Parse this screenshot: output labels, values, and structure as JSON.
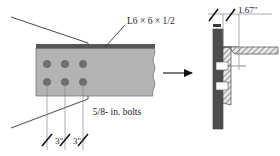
{
  "figure": {
    "labels": {
      "angle_designation": "L6 × 6 × 1/2",
      "bolt_note": "5/8- in. bolts",
      "spacing_1": "3\"",
      "spacing_2": "3\"",
      "edge_distance": "1.67\""
    },
    "colors": {
      "plate_face": "#b3b3b3",
      "plate_top_edge": "#555555",
      "bolt_hole": "#6e6e6e",
      "column": "#4d4d4d",
      "hatch_fill": "#e8e8e8",
      "hatch_line": "#4d4d4d",
      "line": "#333333",
      "text": "#1a1a1a",
      "background": "#ffffff"
    },
    "views": {
      "left": {
        "name": "elevation-view",
        "description": "Front elevation of angle leg showing 6 bolt holes in two rows of three",
        "bolt_rows": 2,
        "bolt_columns": 3,
        "bolt_count": 6
      },
      "right": {
        "name": "section-view",
        "description": "Side section through column and angle showing two bolts and edge distance"
      }
    },
    "icons": {
      "arrow": "arrow-right-icon",
      "break": "break-line-icon",
      "tick": "dimension-tick-icon"
    }
  }
}
